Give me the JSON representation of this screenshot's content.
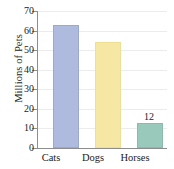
{
  "chart_data": {
    "type": "bar",
    "title": "",
    "subtitle": "",
    "xlabel": "",
    "ylabel": "Millions of Pets",
    "categories": [
      "Cats",
      "Dogs",
      "Horses"
    ],
    "values": [
      62,
      53,
      12
    ],
    "ylim": [
      0,
      70
    ],
    "ytick_labels": [
      "70",
      "60",
      "50",
      "40",
      "30",
      "20",
      "10",
      "0"
    ],
    "ytick_values": [
      70,
      60,
      50,
      40,
      30,
      20,
      10,
      0
    ],
    "ytick_step": 10,
    "grid": true,
    "legend": false,
    "legend_position": "none",
    "data_labels": [
      {
        "category": "Horses",
        "text": "12"
      }
    ],
    "series": [
      {
        "name": "Millions of Pets",
        "values": [
          62,
          53,
          12
        ]
      }
    ],
    "bar_colors": [
      "#aebbdf",
      "#f6e8a4",
      "#98c9bb"
    ],
    "axis_color": "#8d8d8d",
    "grid_color": "#ececec",
    "text_color": "#1b1b1b",
    "background": "#ffffff"
  }
}
